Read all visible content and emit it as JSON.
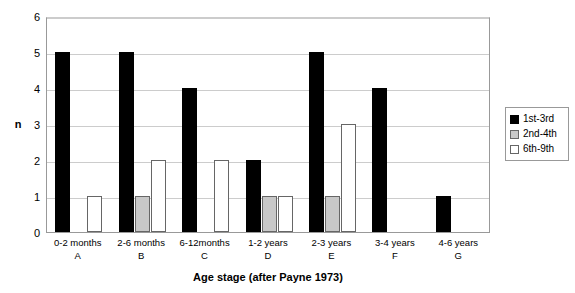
{
  "chart_data": {
    "type": "bar",
    "title": "",
    "xlabel": "Age stage (after Payne 1973)",
    "ylabel": "n",
    "ylim": [
      0,
      6
    ],
    "yticks": [
      0,
      1,
      2,
      3,
      4,
      5,
      6
    ],
    "grid": true,
    "legend_position": "right",
    "categories": [
      "0-2 months",
      "2-6 months",
      "6-12months",
      "1-2 years",
      "2-3 years",
      "3-4 years",
      "4-6 years"
    ],
    "category_codes": [
      "A",
      "B",
      "C",
      "D",
      "E",
      "F",
      "G"
    ],
    "series": [
      {
        "name": "1st-3rd",
        "color": "#000000",
        "values": [
          5,
          5,
          4,
          2,
          5,
          4,
          1
        ]
      },
      {
        "name": "2nd-4th",
        "color": "#c8c8c8",
        "values": [
          0,
          1,
          0,
          1,
          1,
          0,
          0
        ]
      },
      {
        "name": "6th-9th",
        "color": "#ffffff",
        "values": [
          1,
          2,
          2,
          1,
          3,
          0,
          0
        ]
      }
    ]
  },
  "axis": {
    "y_label": "n",
    "x_label": "Age stage (after Payne 1973)",
    "y_tick_labels": [
      "6",
      "5",
      "4",
      "3",
      "2",
      "1",
      "0"
    ]
  },
  "legend": {
    "items": [
      {
        "label": "1st-3rd"
      },
      {
        "label": "2nd-4th"
      },
      {
        "label": "6th-9th"
      }
    ]
  }
}
